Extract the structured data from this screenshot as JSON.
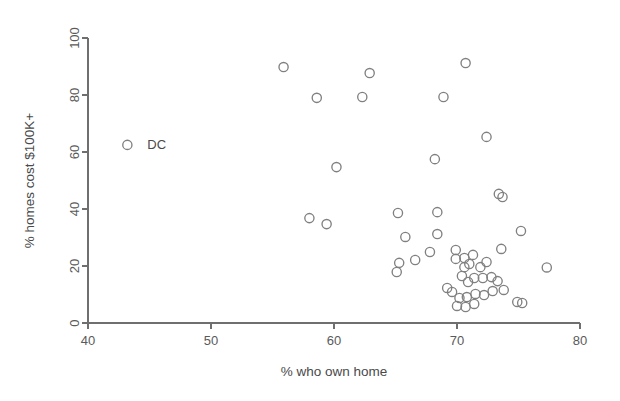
{
  "chart_data": {
    "type": "scatter",
    "title": "",
    "xlabel": "% who own home",
    "ylabel": "% homes cost $100K+",
    "xlim": [
      40,
      80
    ],
    "ylim": [
      0,
      100
    ],
    "xticks": [
      40,
      50,
      60,
      70,
      80
    ],
    "yticks": [
      0,
      20,
      40,
      60,
      80,
      100
    ],
    "xtick_labels": [
      "40",
      "50",
      "60",
      "70",
      "80"
    ],
    "ytick_labels": [
      "0",
      "20",
      "40",
      "60",
      "80",
      "100"
    ],
    "grid": false,
    "legend": "none",
    "marker": "open-circle",
    "marker_color": "#808080",
    "annotations": [
      {
        "text": "DC",
        "x": 43.2,
        "y": 62.5,
        "dx": 10,
        "dy": 0
      }
    ],
    "points": [
      {
        "x": 43.2,
        "y": 62.5,
        "label": "DC"
      },
      {
        "x": 55.9,
        "y": 89.8
      },
      {
        "x": 58.6,
        "y": 79.0
      },
      {
        "x": 62.9,
        "y": 87.7
      },
      {
        "x": 62.3,
        "y": 79.3
      },
      {
        "x": 70.7,
        "y": 91.2
      },
      {
        "x": 68.9,
        "y": 79.3
      },
      {
        "x": 72.4,
        "y": 65.3
      },
      {
        "x": 68.2,
        "y": 57.5
      },
      {
        "x": 60.2,
        "y": 54.7
      },
      {
        "x": 73.4,
        "y": 45.3
      },
      {
        "x": 73.7,
        "y": 44.2
      },
      {
        "x": 58.0,
        "y": 36.8
      },
      {
        "x": 59.4,
        "y": 34.7
      },
      {
        "x": 65.2,
        "y": 38.6
      },
      {
        "x": 68.4,
        "y": 38.9
      },
      {
        "x": 75.2,
        "y": 32.3
      },
      {
        "x": 65.8,
        "y": 30.2
      },
      {
        "x": 68.4,
        "y": 31.2
      },
      {
        "x": 73.6,
        "y": 26.0
      },
      {
        "x": 77.3,
        "y": 19.5
      },
      {
        "x": 65.3,
        "y": 21.1
      },
      {
        "x": 65.1,
        "y": 17.9
      },
      {
        "x": 66.6,
        "y": 22.1
      },
      {
        "x": 67.8,
        "y": 24.9
      },
      {
        "x": 69.9,
        "y": 25.6
      },
      {
        "x": 69.9,
        "y": 22.5
      },
      {
        "x": 70.6,
        "y": 22.8
      },
      {
        "x": 70.6,
        "y": 19.6
      },
      {
        "x": 71.3,
        "y": 23.9
      },
      {
        "x": 71.0,
        "y": 20.7
      },
      {
        "x": 71.9,
        "y": 19.6
      },
      {
        "x": 72.4,
        "y": 21.4
      },
      {
        "x": 69.2,
        "y": 12.3
      },
      {
        "x": 69.6,
        "y": 10.9
      },
      {
        "x": 70.4,
        "y": 16.5
      },
      {
        "x": 70.9,
        "y": 14.4
      },
      {
        "x": 71.4,
        "y": 15.8
      },
      {
        "x": 72.1,
        "y": 15.8
      },
      {
        "x": 72.8,
        "y": 16.1
      },
      {
        "x": 73.3,
        "y": 14.7
      },
      {
        "x": 70.2,
        "y": 8.8
      },
      {
        "x": 70.8,
        "y": 9.1
      },
      {
        "x": 71.5,
        "y": 10.2
      },
      {
        "x": 72.2,
        "y": 9.8
      },
      {
        "x": 72.9,
        "y": 11.2
      },
      {
        "x": 73.8,
        "y": 11.6
      },
      {
        "x": 70.0,
        "y": 6.0
      },
      {
        "x": 70.7,
        "y": 5.6
      },
      {
        "x": 71.4,
        "y": 6.7
      },
      {
        "x": 74.9,
        "y": 7.4
      },
      {
        "x": 75.3,
        "y": 7.0
      }
    ]
  }
}
